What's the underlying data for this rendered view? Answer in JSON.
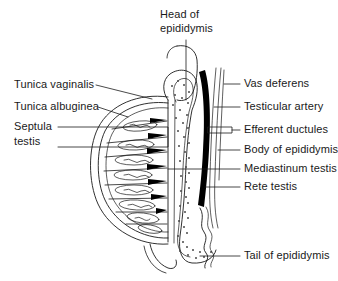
{
  "figure": {
    "ink_color": "#1a1a1a",
    "fill_color": "#000000",
    "background": "#ffffff"
  },
  "labels": {
    "head_of_epididymis_line1": "Head of",
    "head_of_epididymis_line2": "epididymis",
    "tunica_vaginalis": "Tunica vaginalis",
    "tunica_albuginea": "Tunica albuginea",
    "septula_testis_line1": "Septula",
    "septula_testis_line2": "testis",
    "vas_deferens": "Vas deferens",
    "testicular_artery": "Testicular artery",
    "efferent_ductules": "Efferent ductules",
    "body_of_epididymis": "Body of epididymis",
    "mediastinum_testis": "Mediastinum testis",
    "rete_testis": "Rete testis",
    "tail_of_epididymis": "Tail of epididymis"
  }
}
